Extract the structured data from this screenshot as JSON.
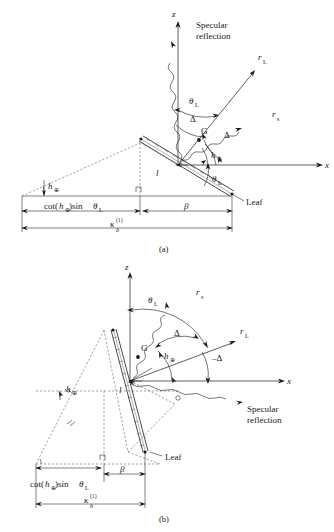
{
  "figure": {
    "caption_a": "(a)",
    "caption_b": "(b)"
  },
  "labels": {
    "z_axis": "z",
    "x_axis": "x",
    "specular": "Specular",
    "reflection": "reflection",
    "r": "r",
    "sub_L": "L",
    "sub_s": "s",
    "theta": "θ",
    "delta": "Δ",
    "delta_neg": "–Δ",
    "G": "G",
    "h": "h",
    "sun_sub": "⊕",
    "leaf": "Leaf",
    "l": "l",
    "beta": "β",
    "kappa": "κ",
    "kappa_sup": "(1)",
    "kappa_sub": "b",
    "cot_open": "cot(",
    "cot_close": ")sin",
    "sin_theta": "θ"
  },
  "panel_a": {
    "name": "leaf-specular-geometry-upper",
    "rays": [
      {
        "name": "r_L",
        "label": "r",
        "subscript": "L"
      },
      {
        "name": "r_s",
        "label": "r",
        "subscript": "s"
      }
    ],
    "angles": [
      {
        "name": "theta_L_top",
        "label": "θ",
        "subscript": "L"
      },
      {
        "name": "theta_L_bottom",
        "label": "θ",
        "subscript": "L"
      },
      {
        "name": "delta_upper",
        "label": "Δ"
      },
      {
        "name": "delta_lower",
        "label": "Δ"
      },
      {
        "name": "h_sun_origin",
        "label": "h",
        "subscript": "⊕"
      },
      {
        "name": "h_sun_left",
        "label": "h",
        "subscript": "⊕"
      }
    ],
    "dimensions": [
      {
        "name": "cot-h-sin-theta",
        "text": "cot(h⊕)sin θL"
      },
      {
        "name": "beta",
        "text": "β"
      },
      {
        "name": "kappa-b-1",
        "text": "κ b (1)"
      }
    ],
    "specular_label": [
      "Specular",
      "reflection"
    ],
    "leaf_label": "Leaf",
    "point_G": "G",
    "length_l": "l"
  },
  "panel_b": {
    "name": "leaf-specular-geometry-lower",
    "rays": [
      {
        "name": "r_s",
        "label": "r",
        "subscript": "s"
      },
      {
        "name": "r_L",
        "label": "r",
        "subscript": "L"
      }
    ],
    "angles": [
      {
        "name": "theta_L",
        "label": "θ",
        "subscript": "L"
      },
      {
        "name": "delta_upper",
        "label": "Δ"
      },
      {
        "name": "delta_lower",
        "label": "–Δ"
      },
      {
        "name": "h_sun_origin",
        "label": "h",
        "subscript": "⊕"
      },
      {
        "name": "h_sun_left",
        "label": "h",
        "subscript": "⊕"
      }
    ],
    "dimensions": [
      {
        "name": "cot-h-sin-theta",
        "text": "cot(h⊕)sin θL"
      },
      {
        "name": "beta",
        "text": "β"
      },
      {
        "name": "kappa-b-1",
        "text": "κ b (1)"
      }
    ],
    "specular_label": [
      "Specular",
      "reflection"
    ],
    "leaf_label": "Leaf",
    "point_G": "G",
    "length_l": "l"
  },
  "colors": {
    "ink": "#1a1a1a",
    "dashed": "#555555",
    "background": "#ffffff"
  }
}
